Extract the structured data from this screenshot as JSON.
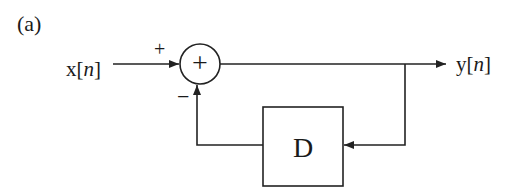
{
  "figure": {
    "panel_label": "(a)",
    "type": "block-diagram"
  },
  "input": {
    "label_main": "x[",
    "label_var": "n",
    "label_close": "]"
  },
  "output": {
    "label_main": "y[",
    "label_var": "n",
    "label_close": "]"
  },
  "summing_junction": {
    "symbol": "+",
    "input_signs": {
      "top_left": "+",
      "bottom": "−"
    }
  },
  "delay_block": {
    "label": "D"
  },
  "colors": {
    "stroke": "#222222",
    "text": "#1a1a1a",
    "background": "#ffffff"
  }
}
